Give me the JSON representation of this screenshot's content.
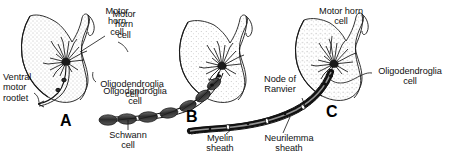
{
  "figure": {
    "background_color": "#ffffff",
    "ink_color": "#111111",
    "stipple_color": "#8a8a8a",
    "caption_fragment": "cell"
  },
  "panels": [
    {
      "letter": "A",
      "name": "panel-a-unmyelinated",
      "labels": [
        {
          "name": "label-motor-horn-cell-a",
          "lines": "Motor\nhorn\ncell",
          "align": "center"
        },
        {
          "name": "label-ventral-motor-rootlet",
          "lines": "Ventral\nmotor\nrootlet",
          "align": "left"
        },
        {
          "name": "label-oligodendroglia-cell-a",
          "lines": "Oligodendroglia\ncell",
          "align": "center"
        }
      ]
    },
    {
      "letter": "B",
      "name": "panel-b-schwann",
      "labels": [
        {
          "name": "label-motor-horn-cell-b",
          "lines": "Motor\nhorn\ncell",
          "align": "center"
        },
        {
          "name": "label-oligodendroglia-cell-b",
          "lines": "Oligodendroglia\ncell",
          "align": "center"
        },
        {
          "name": "label-schwann-cell",
          "lines": "Schwann\ncell",
          "align": "center"
        }
      ]
    },
    {
      "letter": "C",
      "name": "panel-c-myelinated",
      "labels": [
        {
          "name": "label-motor-horn-cell-c",
          "lines": "Motor horn\ncell",
          "align": "center"
        },
        {
          "name": "label-node-of-ranvier",
          "lines": "Node of\nRanvier",
          "align": "center"
        },
        {
          "name": "label-oligodendroglia-cell-c",
          "lines": "Oligodendroglia\ncell",
          "align": "center"
        },
        {
          "name": "label-myelin-sheath",
          "lines": "Myelin\nsheath",
          "align": "center"
        },
        {
          "name": "label-neurilemma-sheath",
          "lines": "Neurilemma\nsheath",
          "align": "center"
        }
      ]
    }
  ],
  "text": {
    "motor_horn_cell_a": "Motor\nhorn\ncell",
    "ventral_motor_rootlet": "Ventral\nmotor\nrootlet",
    "oligodendroglia_cell_a": "Oligodendroglia\ncell",
    "letter_a": "A",
    "motor_horn_cell_b": "Motor\nhorn\ncell",
    "oligodendroglia_cell_b": "Oligodendroglia\ncell",
    "schwann_cell": "Schwann\ncell",
    "letter_b": "B",
    "motor_horn_cell_c": "Motor horn\ncell",
    "node_of_ranvier": "Node of\nRanvier",
    "oligodendroglia_cell_c": "Oligodendroglia\ncell",
    "myelin_sheath": "Myelin\nsheath",
    "neurilemma_sheath": "Neurilemma\nsheath",
    "letter_c": "C",
    "caption_fragment": "cell"
  }
}
